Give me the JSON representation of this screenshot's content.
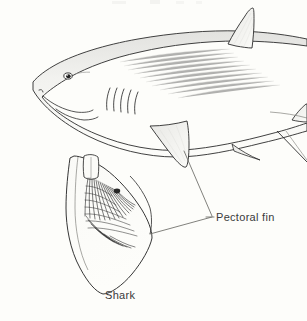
{
  "figure": {
    "subject": "Shark",
    "caption": "Shark",
    "background_color": "#fdfdfa",
    "ink_color": "#2b2b2b",
    "label_color": "#3a3a3a",
    "shading_color": "#d8d8d6"
  },
  "labels": {
    "pectoral_fin": "Pectoral fin",
    "caption": "Shark"
  },
  "annotations": [
    {
      "name": "pectoral-fin-callout",
      "text": "Pectoral fin",
      "leader_from_body": [
        183,
        150
      ],
      "leader_from_inset": [
        148,
        215
      ],
      "leader_to": [
        213,
        217
      ]
    }
  ],
  "parts": [
    {
      "name": "snout",
      "label": ""
    },
    {
      "name": "eye",
      "label": ""
    },
    {
      "name": "mouth",
      "label": ""
    },
    {
      "name": "gill-slits",
      "label": "",
      "count": 5
    },
    {
      "name": "dorsal-fin",
      "label": ""
    },
    {
      "name": "second-dorsal-fin",
      "label": ""
    },
    {
      "name": "pectoral-fin",
      "label": "Pectoral fin"
    },
    {
      "name": "pelvic-fin",
      "label": ""
    },
    {
      "name": "caudal-fin",
      "label": ""
    },
    {
      "name": "fin-rays-inset",
      "label": "",
      "ray_count": 22
    }
  ]
}
